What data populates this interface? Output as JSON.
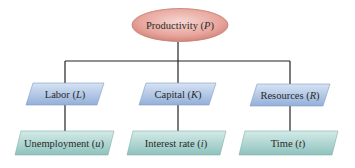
{
  "diagram": {
    "type": "hierarchy",
    "root": {
      "text": "Productivity",
      "symbol": "P"
    },
    "level1": [
      {
        "text": "Labor",
        "symbol": "L"
      },
      {
        "text": "Capital",
        "symbol": "K"
      },
      {
        "text": "Resources",
        "symbol": "R"
      }
    ],
    "level2": [
      {
        "text": "Unemployment",
        "symbol": "u"
      },
      {
        "text": "Interest rate",
        "symbol": "i"
      },
      {
        "text": "Time",
        "symbol": "t"
      }
    ],
    "colors": {
      "root_fill": "#e8a59c",
      "root_stroke": "#b86a60",
      "level1_fill": "#a9c1e2",
      "level2_fill": "#a9d2cf",
      "connector": "#222222"
    }
  }
}
